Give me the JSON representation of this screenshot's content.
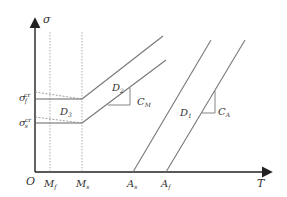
{
  "diagram": {
    "axes": {
      "y_label": "σ",
      "x_label": "T",
      "origin_label": "O"
    },
    "x_ticks": [
      {
        "main": "M",
        "sub": "f"
      },
      {
        "main": "M",
        "sub": "s"
      },
      {
        "main": "A",
        "sub": "s"
      },
      {
        "main": "A",
        "sub": "f"
      }
    ],
    "y_ticks": [
      {
        "main": "σ",
        "sub": "f",
        "sup": "cr"
      },
      {
        "main": "σ",
        "sub": "s",
        "sup": "cr"
      }
    ],
    "regions": [
      {
        "main": "D",
        "sub": "1"
      },
      {
        "main": "D",
        "sub": "2"
      },
      {
        "main": "D",
        "sub": "3"
      }
    ],
    "slopes": [
      {
        "main": "C",
        "sub": "M"
      },
      {
        "main": "C",
        "sub": "A"
      }
    ],
    "colors": {
      "axis": "#222222",
      "line": "#777777",
      "dotted": "#999999"
    }
  }
}
